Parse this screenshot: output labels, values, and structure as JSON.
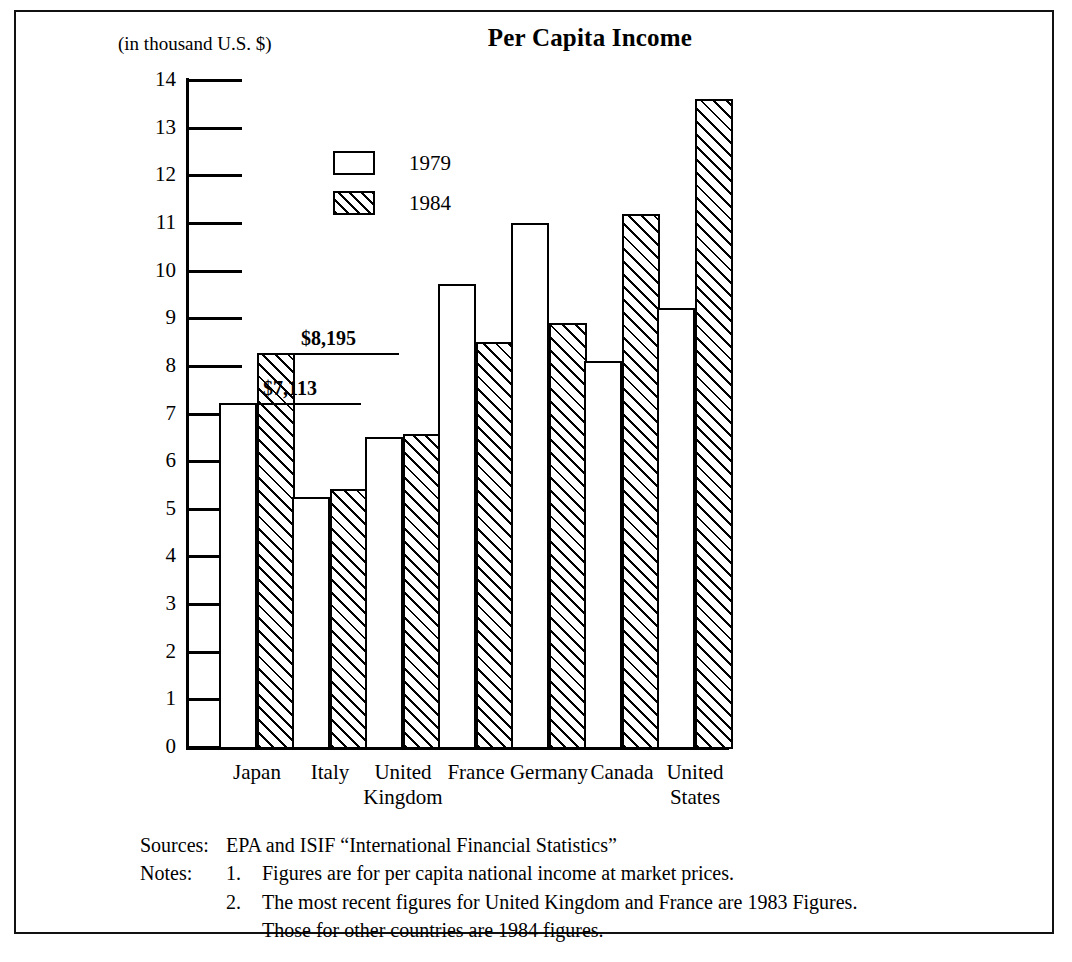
{
  "title": "Per Capita Income",
  "unit_label": "(in thousand U.S. $)",
  "legend": [
    {
      "label": "1979",
      "style": "open"
    },
    {
      "label": "1984",
      "style": "hatched"
    }
  ],
  "notes": {
    "sources_key": "Sources:",
    "sources_text": "EPA and ISIF “International Financial Statistics”",
    "notes_key": "Notes:",
    "note1_num": "1.",
    "note1_text": "Figures are for per capita national income at market prices.",
    "note2_num": "2.",
    "note2_text": "The most recent figures for United Kingdom and France are 1983 Figures.",
    "note2_cont": "Those for other countries are 1984 figures."
  },
  "chart_data": {
    "type": "bar",
    "title": "Per Capita Income",
    "xlabel": "",
    "ylabel": "(in thousand U.S. $)",
    "ylim": [
      0,
      14
    ],
    "yticks": [
      0,
      1,
      2,
      3,
      4,
      5,
      6,
      7,
      8,
      9,
      10,
      11,
      12,
      13,
      14
    ],
    "ytick_labels": [
      "0",
      "1",
      "2",
      "3",
      "4",
      "5",
      "6",
      "7",
      "8",
      "9",
      "10",
      "11",
      "12",
      "13",
      "14"
    ],
    "grid": false,
    "legend_position": "upper-left-inside",
    "categories": [
      "Japan",
      "Italy",
      "United\nKingdom",
      "France",
      "Germany",
      "Canada",
      "United\nStates"
    ],
    "series": [
      {
        "name": "1979",
        "values": [
          7.21,
          5.25,
          6.5,
          9.72,
          11.0,
          8.1,
          9.22
        ]
      },
      {
        "name": "1984",
        "values": [
          8.28,
          5.42,
          6.56,
          8.5,
          8.9,
          11.18,
          13.6
        ]
      }
    ],
    "annotations": [
      {
        "text": "$8,195",
        "series": "1984",
        "category": "Japan"
      },
      {
        "text": "$7,113",
        "series": "1979",
        "category": "Japan"
      }
    ]
  }
}
